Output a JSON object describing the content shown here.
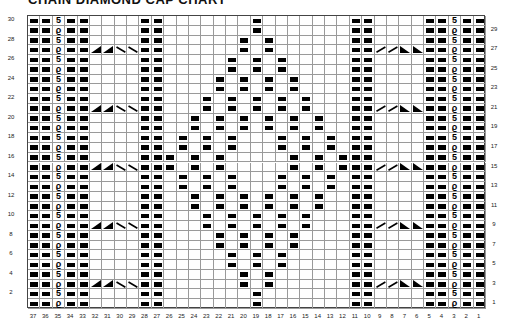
{
  "title": "CHAIN DIAMOND CAP CHART",
  "chart": {
    "columns": 37,
    "rows": 30,
    "column_labels": [
      37,
      36,
      35,
      34,
      33,
      32,
      31,
      30,
      29,
      28,
      27,
      26,
      25,
      24,
      23,
      22,
      21,
      20,
      19,
      18,
      17,
      16,
      15,
      14,
      13,
      12,
      11,
      10,
      9,
      8,
      7,
      6,
      5,
      4,
      3,
      2,
      1
    ],
    "left_row_labels": [
      30,
      28,
      26,
      24,
      22,
      20,
      18,
      16,
      14,
      12,
      10,
      8,
      6,
      4,
      2
    ],
    "right_row_labels": [
      29,
      27,
      25,
      23,
      21,
      19,
      17,
      15,
      13,
      11,
      9,
      7,
      5,
      3,
      1
    ],
    "symbols": {
      "purl": "black-bar",
      "twist_even": "5",
      "twist_odd": "ϱ",
      "cable_left": [
        "lt",
        "lt",
        "bs",
        "bs"
      ],
      "cable_right": [
        "fs",
        "fs",
        "rt",
        "rt"
      ]
    },
    "purl_columns_all_rows": [
      37,
      36,
      34,
      33,
      28,
      27,
      11,
      10,
      5,
      4,
      2,
      1
    ],
    "twist_columns": [
      35,
      3
    ],
    "cable_rows": [
      27,
      21,
      15,
      9,
      3
    ],
    "cable_left_columns": [
      32,
      31,
      30,
      29
    ],
    "cable_right_columns": [
      9,
      8,
      7,
      6
    ],
    "diamond_purls": {
      "30": [
        19
      ],
      "29": [
        19
      ],
      "28": [
        20,
        18
      ],
      "27": [
        20,
        18
      ],
      "26": [
        21,
        19,
        17
      ],
      "25": [
        21,
        19,
        17
      ],
      "24": [
        22,
        20,
        18,
        16
      ],
      "23": [
        22,
        20,
        18,
        16
      ],
      "22": [
        23,
        21,
        19,
        17,
        15
      ],
      "21": [
        23,
        21,
        19,
        17,
        15
      ],
      "20": [
        24,
        22,
        20,
        18,
        16,
        14
      ],
      "19": [
        24,
        22,
        20,
        18,
        16,
        14
      ],
      "18": [
        25,
        23,
        21,
        17,
        15,
        13
      ],
      "17": [
        25,
        23,
        21,
        17,
        15,
        13
      ],
      "16": [
        26,
        24,
        22,
        16,
        14,
        12
      ],
      "15": [
        26,
        24,
        22,
        16,
        14,
        12
      ],
      "14": [
        25,
        23,
        21,
        17,
        15,
        13
      ],
      "13": [
        25,
        23,
        21,
        17,
        15,
        13
      ],
      "12": [
        24,
        22,
        20,
        18,
        16,
        14
      ],
      "11": [
        24,
        22,
        20,
        18,
        16,
        14
      ],
      "10": [
        23,
        21,
        19,
        17,
        15
      ],
      "9": [
        23,
        21,
        19,
        17,
        15
      ],
      "8": [
        22,
        20,
        18,
        16
      ],
      "7": [
        22,
        20,
        18,
        16
      ],
      "6": [
        21,
        19,
        17
      ],
      "5": [
        21,
        19,
        17
      ],
      "4": [
        20,
        18
      ],
      "3": [
        20,
        18
      ],
      "2": [
        19
      ],
      "1": [
        19
      ]
    }
  }
}
